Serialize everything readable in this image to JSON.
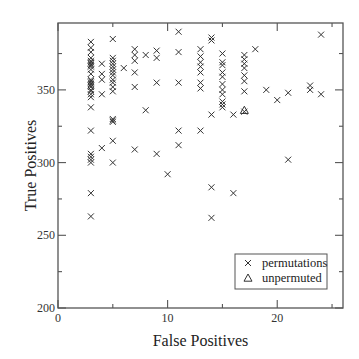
{
  "chart_data": {
    "type": "scatter",
    "title": "",
    "xlabel": "False Positives",
    "ylabel": "True Positives",
    "xlim": [
      0,
      26
    ],
    "ylim": [
      200,
      396
    ],
    "xticks": [
      0,
      10,
      20
    ],
    "xminor_ticks": [
      5,
      15,
      25
    ],
    "yticks": [
      200,
      250,
      300,
      350
    ],
    "yminor_ticks": [
      225,
      275,
      325,
      375
    ],
    "grid": false,
    "legend_position": "lower right",
    "legend": [
      {
        "label": "permutations",
        "marker": "x"
      },
      {
        "label": "unpermuted",
        "marker": "triangle"
      }
    ],
    "series": [
      {
        "name": "permutations",
        "marker": "x",
        "points": [
          [
            3,
            383
          ],
          [
            3,
            379
          ],
          [
            3,
            376
          ],
          [
            3,
            372
          ],
          [
            3,
            370
          ],
          [
            3,
            369
          ],
          [
            3,
            368
          ],
          [
            3,
            367
          ],
          [
            3,
            366
          ],
          [
            3,
            364
          ],
          [
            3,
            361
          ],
          [
            3,
            357
          ],
          [
            3,
            356
          ],
          [
            3,
            355
          ],
          [
            3,
            354
          ],
          [
            3,
            353
          ],
          [
            3,
            352
          ],
          [
            3,
            350
          ],
          [
            3,
            349
          ],
          [
            3,
            347
          ],
          [
            3,
            345
          ],
          [
            3,
            338
          ],
          [
            3,
            322
          ],
          [
            3,
            306
          ],
          [
            3,
            304
          ],
          [
            3,
            302
          ],
          [
            3,
            300
          ],
          [
            3,
            279
          ],
          [
            3,
            263
          ],
          [
            4,
            368
          ],
          [
            4,
            361
          ],
          [
            4,
            357
          ],
          [
            4,
            347
          ],
          [
            4,
            310
          ],
          [
            5,
            385
          ],
          [
            5,
            372
          ],
          [
            5,
            370
          ],
          [
            5,
            368
          ],
          [
            5,
            366
          ],
          [
            5,
            364
          ],
          [
            5,
            362
          ],
          [
            5,
            360
          ],
          [
            5,
            357
          ],
          [
            5,
            355
          ],
          [
            5,
            352
          ],
          [
            5,
            349
          ],
          [
            5,
            330
          ],
          [
            5,
            329
          ],
          [
            5,
            328
          ],
          [
            5,
            315
          ],
          [
            5,
            300
          ],
          [
            6,
            365
          ],
          [
            7,
            378
          ],
          [
            7,
            374
          ],
          [
            7,
            370
          ],
          [
            7,
            362
          ],
          [
            7,
            352
          ],
          [
            7,
            309
          ],
          [
            8,
            374
          ],
          [
            8,
            336
          ],
          [
            9,
            377
          ],
          [
            9,
            372
          ],
          [
            9,
            355
          ],
          [
            9,
            306
          ],
          [
            10,
            292
          ],
          [
            11,
            390
          ],
          [
            11,
            376
          ],
          [
            11,
            355
          ],
          [
            11,
            322
          ],
          [
            11,
            312
          ],
          [
            13,
            378
          ],
          [
            13,
            373
          ],
          [
            13,
            369
          ],
          [
            13,
            366
          ],
          [
            13,
            362
          ],
          [
            13,
            355
          ],
          [
            13,
            351
          ],
          [
            13,
            322
          ],
          [
            14,
            386
          ],
          [
            14,
            384
          ],
          [
            14,
            333
          ],
          [
            14,
            283
          ],
          [
            14,
            262
          ],
          [
            15,
            375
          ],
          [
            15,
            369
          ],
          [
            15,
            367
          ],
          [
            15,
            362
          ],
          [
            15,
            359
          ],
          [
            15,
            354
          ],
          [
            15,
            350
          ],
          [
            15,
            347
          ],
          [
            15,
            342
          ],
          [
            15,
            340
          ],
          [
            15,
            338
          ],
          [
            16,
            333
          ],
          [
            16,
            279
          ],
          [
            17,
            374
          ],
          [
            17,
            371
          ],
          [
            17,
            368
          ],
          [
            17,
            365
          ],
          [
            17,
            360
          ],
          [
            17,
            356
          ],
          [
            17,
            349
          ],
          [
            17,
            335
          ],
          [
            18,
            378
          ],
          [
            19,
            350
          ],
          [
            20,
            343
          ],
          [
            21,
            348
          ],
          [
            21,
            302
          ],
          [
            23,
            353
          ],
          [
            23,
            350
          ],
          [
            24,
            388
          ],
          [
            24,
            347
          ]
        ]
      },
      {
        "name": "unpermuted",
        "marker": "triangle",
        "points": [
          [
            17,
            336
          ]
        ]
      }
    ]
  },
  "colors": {
    "axis": "#555555",
    "marker": "#333333",
    "background": "#ffffff"
  }
}
